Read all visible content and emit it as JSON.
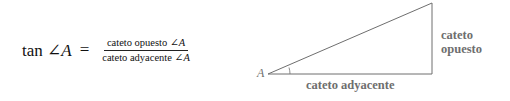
{
  "formula": {
    "lhs_func": "tan",
    "lhs_angle": "∠",
    "lhs_var": "A",
    "equals": "=",
    "numerator_text": "cateto opuesto ",
    "numerator_angle": "∠",
    "numerator_var": "A",
    "denominator_text": "cateto adyacente ",
    "denominator_angle": "∠",
    "denominator_var": "A"
  },
  "triangle": {
    "vertex_label": "A",
    "opposite_label_line1": "cateto",
    "opposite_label_line2": "opuesto",
    "adjacent_label": "cateto adyacente",
    "stroke_color": "#6e6e6e"
  }
}
